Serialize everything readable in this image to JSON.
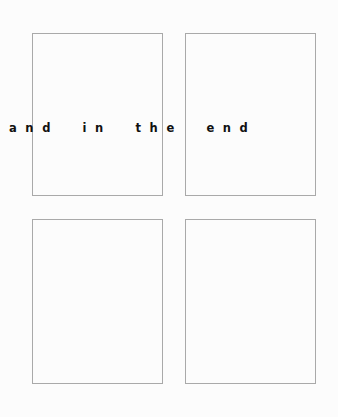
{
  "artwork": {
    "phrase": "and in the end",
    "background_color": "#fcfcfc",
    "text_color": "#111111",
    "frame_color": "#a9a9a9",
    "panels": [
      {
        "id": "panel-top-left",
        "label": ""
      },
      {
        "id": "panel-top-right",
        "label": ""
      },
      {
        "id": "panel-bottom-left",
        "label": ""
      },
      {
        "id": "panel-bottom-right",
        "label": ""
      }
    ]
  }
}
